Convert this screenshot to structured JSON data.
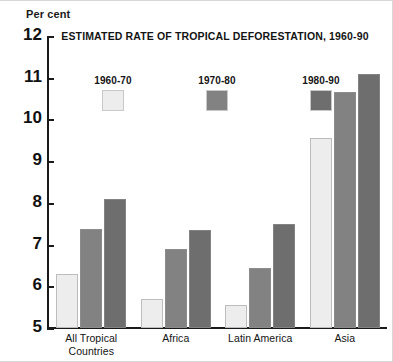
{
  "chart_data": {
    "type": "bar",
    "title": "ESTIMATED RATE OF TROPICAL DEFORESTATION, 1960-90",
    "xlabel": "",
    "ylabel": "Per cent",
    "ylim": [
      5,
      12
    ],
    "yticks": [
      12,
      11,
      10,
      9,
      8,
      7,
      6,
      5
    ],
    "grid": false,
    "legend_position": "top-center",
    "categories": [
      "All Tropical Countries",
      "Africa",
      "Latin America",
      "Asia"
    ],
    "category_lines": [
      [
        "All Tropical",
        "Countries"
      ],
      [
        "Africa"
      ],
      [
        "Latin America"
      ],
      [
        "Asia"
      ]
    ],
    "series": [
      {
        "name": "1960-70",
        "color": "#ededed",
        "values": [
          6.3,
          5.7,
          5.55,
          9.55
        ]
      },
      {
        "name": "1970-80",
        "color": "#828282",
        "values": [
          7.38,
          6.9,
          6.45,
          10.65
        ]
      },
      {
        "name": "1980-90",
        "color": "#6e6e6e",
        "values": [
          8.1,
          7.35,
          7.5,
          11.1
        ]
      }
    ]
  },
  "axis": {
    "unit_label": "Per cent"
  },
  "legend": {
    "items": [
      {
        "label": "1960-70"
      },
      {
        "label": "1970-80"
      },
      {
        "label": "1980-90"
      }
    ]
  }
}
